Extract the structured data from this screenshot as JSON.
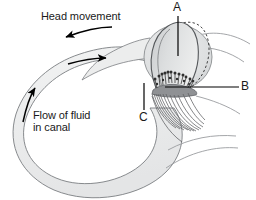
{
  "figure": {
    "kind": "anatomical-diagram",
    "background_color": "#ffffff"
  },
  "labels": {
    "head_movement": "Head movement",
    "flow_of_fluid_line1": "Flow of fluid",
    "flow_of_fluid_line2": "in canal",
    "callout_a": "A",
    "callout_b": "B",
    "callout_c": "C"
  },
  "colors": {
    "outline": "#6f7377",
    "canal_fill": "#eceded",
    "ampulla_fill": "#dcdedf",
    "cupula_fill": "#d2d4d6",
    "hair_cells": "#3c3c3c",
    "nerve_fibers": "#5a5c5f",
    "arrow": "#000000",
    "text": "#1a1a1a",
    "leader_line": "#000000",
    "dashed_outline": "#2e2e2e"
  },
  "arrows": {
    "head_movement_direction": "left",
    "canal_top_direction": "right",
    "canal_left_direction": "up"
  },
  "callout_targets": {
    "a": "cupula",
    "b": "nerve-fibers",
    "c": "hair-cells"
  }
}
